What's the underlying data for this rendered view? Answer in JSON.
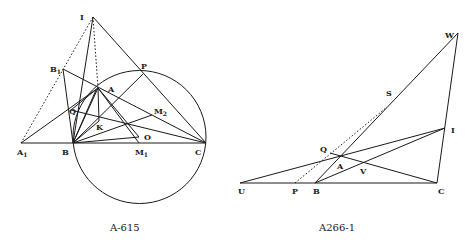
{
  "figures": [
    {
      "id": "left",
      "caption": "A-615",
      "points": {
        "I": {
          "label": "I"
        },
        "B1": {
          "label": "B",
          "sub": "1"
        },
        "A": {
          "label": "A"
        },
        "P": {
          "label": "P"
        },
        "M2": {
          "label": "M",
          "sub": "2"
        },
        "Q": {
          "label": "Q"
        },
        "K": {
          "label": "K"
        },
        "O": {
          "label": "O"
        },
        "A1": {
          "label": "A",
          "sub": "1"
        },
        "B": {
          "label": "B"
        },
        "M1": {
          "label": "M",
          "sub": "1"
        },
        "C": {
          "label": "C"
        }
      }
    },
    {
      "id": "right",
      "caption": "A266-1",
      "points": {
        "W": {
          "label": "W"
        },
        "S": {
          "label": "S"
        },
        "I": {
          "label": "I"
        },
        "Q": {
          "label": "Q"
        },
        "A": {
          "label": "A"
        },
        "V": {
          "label": "V"
        },
        "U": {
          "label": "U"
        },
        "P": {
          "label": "P"
        },
        "B": {
          "label": "B"
        },
        "C": {
          "label": "C"
        }
      }
    }
  ]
}
